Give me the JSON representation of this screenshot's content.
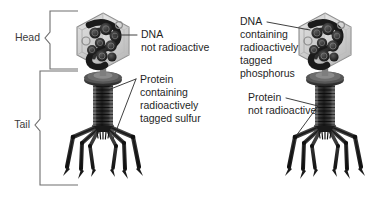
{
  "figure": {
    "background_color": "#ffffff",
    "ink_color": "#1f1f1f",
    "brace_color": "#6e6e6e"
  },
  "braces": {
    "head_label": "Head",
    "tail_label": "Tail"
  },
  "left_panel": {
    "name": "sulfur-labeled-phage",
    "dna_label": {
      "line1": "DNA",
      "line2": "not radioactive"
    },
    "protein_label": {
      "line1": "Protein",
      "line2": "containing",
      "line3": "radioactively",
      "line4": "tagged sulfur"
    }
  },
  "right_panel": {
    "name": "phosphorus-labeled-phage",
    "dna_label": {
      "line1": "DNA",
      "line2": "containing",
      "line3": "radioactively",
      "line4": "tagged",
      "line5": "phosphorus"
    },
    "protein_label": {
      "line1": "Protein",
      "line2": "not radioactive"
    }
  },
  "icons": {
    "capsid": "hexagonal-capsid-icon",
    "dna_coil": "dna-coil-icon",
    "collar": "tail-collar-icon",
    "sheath": "tail-sheath-icon",
    "baseplate": "baseplate-icon",
    "fibers": "tail-fiber-icon"
  }
}
